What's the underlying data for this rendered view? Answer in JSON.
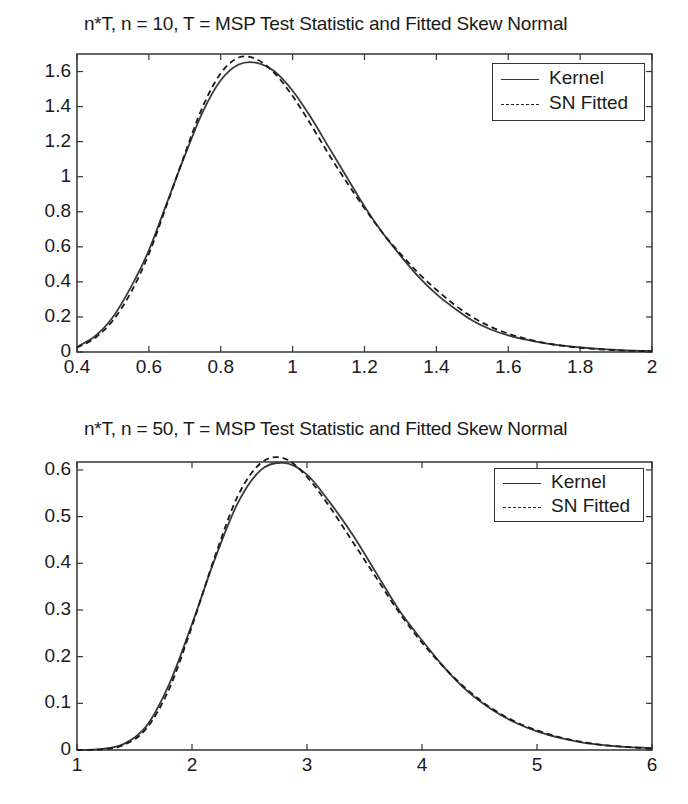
{
  "chart_data": [
    {
      "type": "line",
      "title": "n*T, n = 10, T = MSP Test Statistic and Fitted Skew Normal",
      "xlabel": "",
      "ylabel": "",
      "xlim": [
        0.4,
        2
      ],
      "ylim": [
        0,
        1.7
      ],
      "grid": false,
      "legend_position": "upper right",
      "xticks": [
        0.4,
        0.6,
        0.8,
        1,
        1.2,
        1.4,
        1.6,
        1.8,
        2
      ],
      "xtick_labels": [
        "0.4",
        "0.6",
        "0.8",
        "1",
        "1.2",
        "1.4",
        "1.6",
        "1.8",
        "2"
      ],
      "yticks": [
        0,
        0.2,
        0.4,
        0.6,
        0.8,
        1,
        1.2,
        1.4,
        1.6
      ],
      "ytick_labels": [
        "0",
        "0.2",
        "0.4",
        "0.6",
        "0.8",
        "1",
        "1.2",
        "1.4",
        "1.6"
      ],
      "series": [
        {
          "name": "Kernel",
          "style": "solid",
          "x": [
            0.4,
            0.45,
            0.5,
            0.55,
            0.6,
            0.65,
            0.7,
            0.75,
            0.8,
            0.85,
            0.9,
            0.95,
            1.0,
            1.05,
            1.1,
            1.15,
            1.2,
            1.25,
            1.3,
            1.35,
            1.4,
            1.45,
            1.5,
            1.55,
            1.6,
            1.65,
            1.7,
            1.75,
            1.8,
            1.85,
            1.9,
            1.95,
            2.0
          ],
          "y": [
            0.03,
            0.09,
            0.2,
            0.37,
            0.58,
            0.85,
            1.12,
            1.37,
            1.55,
            1.64,
            1.65,
            1.6,
            1.49,
            1.34,
            1.17,
            1.0,
            0.83,
            0.68,
            0.55,
            0.43,
            0.33,
            0.25,
            0.18,
            0.13,
            0.095,
            0.07,
            0.05,
            0.036,
            0.026,
            0.018,
            0.012,
            0.008,
            0.006
          ]
        },
        {
          "name": "SN Fitted",
          "style": "dashed",
          "x": [
            0.4,
            0.45,
            0.5,
            0.55,
            0.6,
            0.65,
            0.7,
            0.75,
            0.8,
            0.85,
            0.9,
            0.95,
            1.0,
            1.05,
            1.1,
            1.15,
            1.2,
            1.25,
            1.3,
            1.35,
            1.4,
            1.45,
            1.5,
            1.55,
            1.6,
            1.65,
            1.7,
            1.75,
            1.8,
            1.85,
            1.9,
            1.95,
            2.0
          ],
          "y": [
            0.025,
            0.08,
            0.18,
            0.34,
            0.56,
            0.84,
            1.13,
            1.4,
            1.59,
            1.68,
            1.67,
            1.59,
            1.46,
            1.3,
            1.13,
            0.97,
            0.82,
            0.68,
            0.56,
            0.45,
            0.355,
            0.27,
            0.2,
            0.145,
            0.105,
            0.075,
            0.052,
            0.036,
            0.024,
            0.016,
            0.01,
            0.006,
            0.004
          ]
        }
      ]
    },
    {
      "type": "line",
      "title": "n*T, n = 50, T = MSP Test Statistic and Fitted Skew Normal",
      "xlabel": "",
      "ylabel": "",
      "xlim": [
        1,
        6
      ],
      "ylim": [
        0,
        0.617
      ],
      "grid": false,
      "legend_position": "upper right",
      "xticks": [
        1,
        2,
        3,
        4,
        5,
        6
      ],
      "xtick_labels": [
        "1",
        "2",
        "3",
        "4",
        "5",
        "6"
      ],
      "yticks": [
        0,
        0.1,
        0.2,
        0.3,
        0.4,
        0.5,
        0.6
      ],
      "ytick_labels": [
        "0",
        "0.1",
        "0.2",
        "0.3",
        "0.4",
        "0.5",
        "0.6"
      ],
      "series": [
        {
          "name": "Kernel",
          "style": "solid",
          "x": [
            1.0,
            1.2,
            1.4,
            1.6,
            1.8,
            2.0,
            2.2,
            2.4,
            2.6,
            2.8,
            3.0,
            3.2,
            3.4,
            3.6,
            3.8,
            4.0,
            4.2,
            4.4,
            4.6,
            4.8,
            5.0,
            5.2,
            5.4,
            5.6,
            5.8,
            6.0
          ],
          "y": [
            0.0,
            0.002,
            0.012,
            0.05,
            0.14,
            0.27,
            0.41,
            0.53,
            0.6,
            0.615,
            0.59,
            0.53,
            0.46,
            0.38,
            0.3,
            0.235,
            0.175,
            0.125,
            0.088,
            0.06,
            0.04,
            0.026,
            0.016,
            0.01,
            0.006,
            0.004
          ]
        },
        {
          "name": "SN Fitted",
          "style": "dashed",
          "x": [
            1.0,
            1.2,
            1.4,
            1.6,
            1.8,
            2.0,
            2.2,
            2.4,
            2.6,
            2.8,
            3.0,
            3.2,
            3.4,
            3.6,
            3.8,
            4.0,
            4.2,
            4.4,
            4.6,
            4.8,
            5.0,
            5.2,
            5.4,
            5.6,
            5.8,
            6.0
          ],
          "y": [
            0.0,
            0.001,
            0.01,
            0.045,
            0.13,
            0.265,
            0.415,
            0.545,
            0.615,
            0.625,
            0.585,
            0.52,
            0.445,
            0.37,
            0.295,
            0.23,
            0.175,
            0.128,
            0.09,
            0.062,
            0.042,
            0.027,
            0.017,
            0.01,
            0.006,
            0.003
          ]
        }
      ]
    }
  ],
  "plots": [
    {
      "title": "n*T, n = 10, T = MSP Test Statistic and Fitted Skew Normal",
      "legend": {
        "kernel_label": "Kernel",
        "sn_label": "SN Fitted"
      }
    },
    {
      "title": "n*T, n = 50, T = MSP Test Statistic and Fitted Skew Normal",
      "legend": {
        "kernel_label": "Kernel",
        "sn_label": "SN Fitted"
      }
    }
  ]
}
